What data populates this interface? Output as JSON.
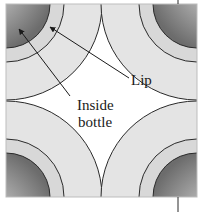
{
  "diagram": {
    "labels": {
      "lip": "Lip",
      "inside_line1": "Inside",
      "inside_line2": "bottle"
    },
    "colors": {
      "box_fill": "#e4e4e4",
      "gap_fill": "#ffffff",
      "outline": "#2a2a2a",
      "inside_dark": "#6a6a6a",
      "inside_light": "#f4f4f4"
    },
    "geometry": {
      "box": {
        "x": 6,
        "y": 4,
        "size": 191
      },
      "outer_radius": 96,
      "lip_radius": 58,
      "inside_radius": 44
    }
  }
}
